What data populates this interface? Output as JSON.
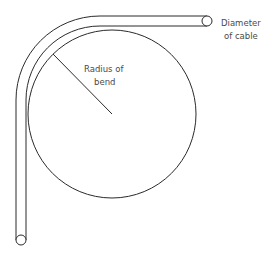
{
  "diagram": {
    "labels": {
      "radius_line1": "Radius of",
      "radius_line2": "bend",
      "diameter_line1": "Diameter",
      "diameter_line2": "of cable"
    },
    "colors": {
      "stroke": "#2a2a2a",
      "text": "#4a4a4a",
      "background": "#ffffff"
    }
  }
}
